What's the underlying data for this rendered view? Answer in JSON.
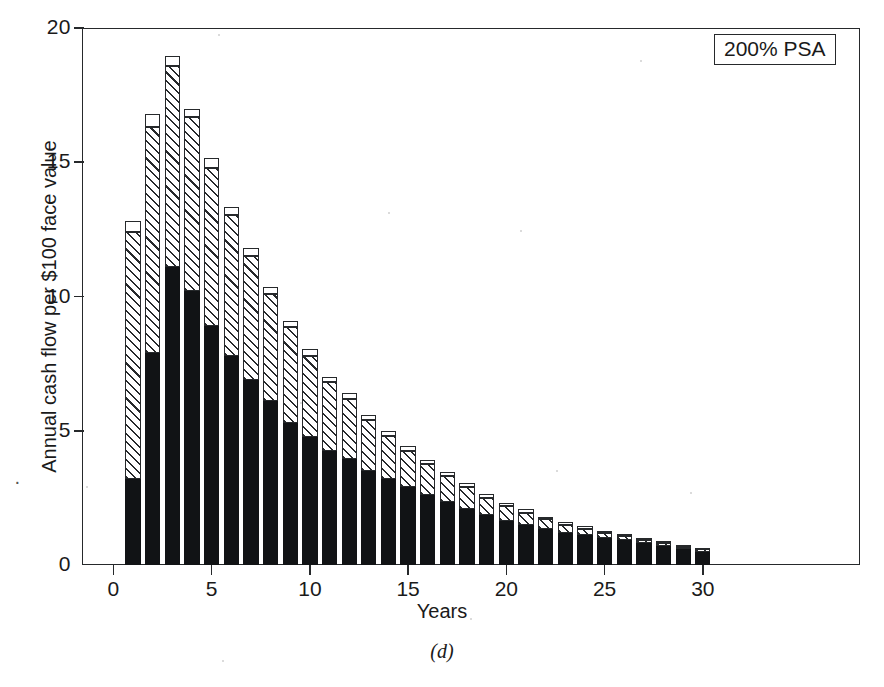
{
  "figure": {
    "caption": "(d)",
    "annotation": "200% PSA"
  },
  "chart_data": {
    "type": "bar",
    "stacked": true,
    "title": "",
    "subtitle": "",
    "annotation": "200% PSA",
    "xlabel": "Years",
    "ylabel": "Annual cash flow per $100 face value",
    "xlim": [
      -1.6,
      38
    ],
    "ylim": [
      0,
      20
    ],
    "xticks": [
      0,
      5,
      10,
      15,
      20,
      25,
      30
    ],
    "xtick_labels": [
      "0",
      "5",
      "10",
      "15",
      "20",
      "25",
      "30"
    ],
    "yticks": [
      0,
      5,
      10,
      15,
      20
    ],
    "ytick_labels": [
      "0",
      "5",
      "10",
      "15",
      "20"
    ],
    "grid": false,
    "legend": null,
    "categories": [
      1,
      2,
      3,
      4,
      5,
      6,
      7,
      8,
      9,
      10,
      11,
      12,
      13,
      14,
      15,
      16,
      17,
      18,
      19,
      20,
      21,
      22,
      23,
      24,
      25,
      26,
      27,
      28,
      29,
      30
    ],
    "series": [
      {
        "name": "segment-black",
        "style": "solid-black",
        "values": [
          3.2,
          7.9,
          11.1,
          10.2,
          8.9,
          7.8,
          6.9,
          6.1,
          5.3,
          4.75,
          4.25,
          3.95,
          3.5,
          3.2,
          2.9,
          2.6,
          2.35,
          2.1,
          1.85,
          1.65,
          1.5,
          1.35,
          1.2,
          1.1,
          1.0,
          0.92,
          0.82,
          0.72,
          0.6,
          0.5
        ]
      },
      {
        "name": "segment-hatched",
        "style": "diagonal-hatch",
        "values": [
          9.2,
          8.4,
          7.5,
          6.5,
          5.9,
          5.25,
          4.6,
          4.0,
          3.55,
          3.05,
          2.55,
          2.25,
          1.9,
          1.6,
          1.35,
          1.15,
          0.95,
          0.8,
          0.65,
          0.55,
          0.45,
          0.35,
          0.3,
          0.25,
          0.2,
          0.16,
          0.12,
          0.09,
          0.06,
          0.04
        ]
      },
      {
        "name": "segment-white",
        "style": "open-white",
        "values": [
          0.4,
          0.5,
          0.35,
          0.3,
          0.35,
          0.3,
          0.3,
          0.25,
          0.25,
          0.25,
          0.2,
          0.2,
          0.2,
          0.2,
          0.2,
          0.15,
          0.15,
          0.15,
          0.15,
          0.12,
          0.12,
          0.1,
          0.1,
          0.1,
          0.08,
          0.08,
          0.06,
          0.05,
          0.05,
          0.04
        ]
      }
    ],
    "totals": [
      12.8,
      16.8,
      18.95,
      17.0,
      15.15,
      13.35,
      11.8,
      10.35,
      9.1,
      8.05,
      7.0,
      6.4,
      5.6,
      5.0,
      4.45,
      3.9,
      3.45,
      3.05,
      2.65,
      2.32,
      2.07,
      1.8,
      1.6,
      1.45,
      1.28,
      1.16,
      1.0,
      0.86,
      0.71,
      0.58
    ]
  }
}
